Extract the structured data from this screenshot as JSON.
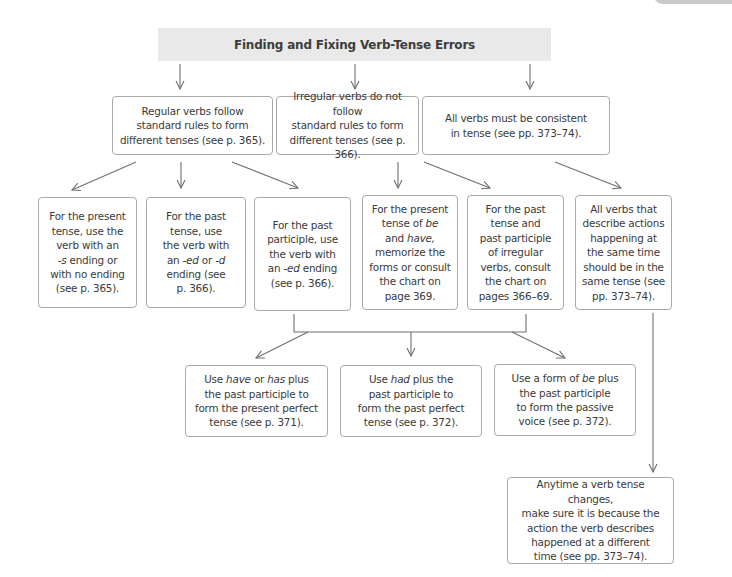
{
  "title": "Finding and Fixing Verb-Tense Errors",
  "row1": [
    {
      "id": "regular",
      "html": "Regular verbs follow<br>standard rules to form<br>different tenses (see p. 365)."
    },
    {
      "id": "irregular",
      "html": "Irregular verbs do not follow<br>standard rules to form<br>different tenses (see p. 366)."
    },
    {
      "id": "consistent",
      "html": "All verbs must be consistent<br>in tense (see pp. 373–74)."
    }
  ],
  "row2": [
    {
      "id": "present",
      "html": "For the present<br>tense, use the<br>verb with an<br><i>-s</i> ending or<br>with no ending<br>(see p. 365)."
    },
    {
      "id": "past",
      "html": "For the past<br>tense, use<br>the verb with<br>an <i>-ed</i> or <i>-d</i><br>ending (see<br>p. 366)."
    },
    {
      "id": "past-participle",
      "html": "For the past<br>participle, use<br>the verb with<br>an <i>-ed</i> ending<br>(see p. 366)."
    },
    {
      "id": "be-have",
      "html": "For the present<br>tense of <i>be</i><br>and <i>have,</i><br>memorize the<br>forms or consult<br>the chart on<br>page 369."
    },
    {
      "id": "irregular-chart",
      "html": "For the past<br>tense and<br>past participle<br>of irregular<br>verbs, consult<br>the chart on<br>pages 366–69."
    },
    {
      "id": "same-time",
      "html": "All verbs that<br>describe actions<br>happening at<br>the same time<br>should be in the<br>same tense (see<br>pp. 373–74)."
    }
  ],
  "row3": [
    {
      "id": "present-perfect",
      "html": "Use <i>have</i> or <i>has</i> plus<br>the past participle to<br>form the present perfect<br>tense (see p. 371)."
    },
    {
      "id": "past-perfect",
      "html": "Use <i>had</i> plus the<br>past participle to<br>form the past perfect<br>tense (see p. 372)."
    },
    {
      "id": "passive",
      "html": "Use a form of <i>be</i> plus<br>the past participle<br>to form the passive<br>voice (see p. 372)."
    }
  ],
  "row4": [
    {
      "id": "tense-change",
      "html": "Anytime a verb tense changes,<br>make sure it is because the<br>action the verb describes<br>happened at a different<br>time (see pp. 373–74)."
    }
  ],
  "colors": {
    "title_bg": "#e9e9e9",
    "border": "#a9a9a9",
    "arrow": "#6f6f6f",
    "text": "#3a3a3a"
  }
}
